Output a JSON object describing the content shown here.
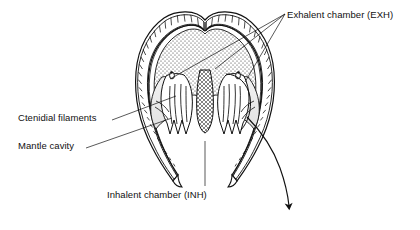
{
  "figure": {
    "stroke_color": "#111111",
    "fill_color": "#ffffff",
    "background_color": "#ffffff"
  },
  "labels": {
    "exhalent_chamber": "Exhalent chamber (EXH)",
    "ctenidial_filaments": "Ctenidial filaments",
    "mantle_cavity": "Mantle cavity",
    "inhalent_chamber": "Inhalent chamber (INH)"
  },
  "annotations": {
    "exhalent_leader_count": 3,
    "ctenidial_leader_count": 1,
    "mantle_leader_count": 1,
    "inhalent_leader_count": 1,
    "current_arrow": "exhalent-current-arrow"
  },
  "structures": {
    "shell_margin": "hatched shell valve margin",
    "visceral_mass": "stippled visceral mass",
    "foot": "cross-hatched foot",
    "ctenidia": "W-shaped ctenidial filaments",
    "gill_axis_left": "left gill axis",
    "gill_axis_right": "right gill axis"
  }
}
